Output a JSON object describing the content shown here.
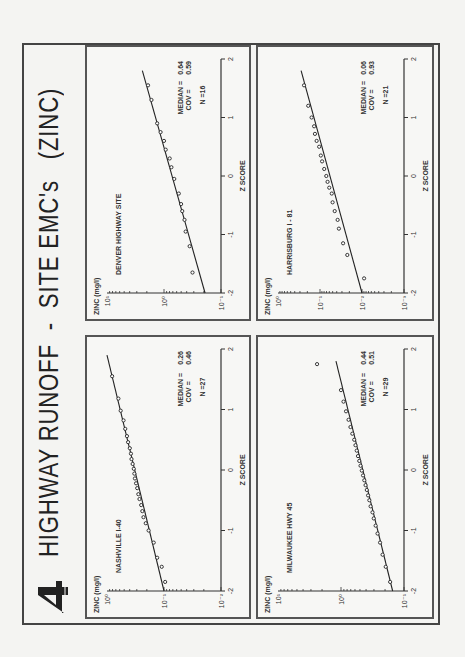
{
  "page": {
    "figure_number": "4",
    "title": "HIGHWAY RUNOFF  -  SITE EMC's   (ZINC)"
  },
  "chart_data": [
    {
      "type": "scatter",
      "title": "NASHVILLE  I-40",
      "xlabel": "Z  SCORE",
      "ylabel": "ZINC  (mg/l)",
      "x_ticks": [
        "-2",
        "-1",
        "0",
        "1",
        "2"
      ],
      "y_ticks": [
        "10^-2",
        "10^-1",
        "10^0"
      ],
      "y_tick_labels": [
        "10⁻²",
        "10⁻¹",
        "10⁰"
      ],
      "yscale": "log",
      "ylim_log10": [
        -2,
        0
      ],
      "xlim": [
        -2,
        2
      ],
      "stats": {
        "median_label": "MEDIAN =",
        "median": "0.26",
        "cov_label": "COV   =",
        "cov": "0.46",
        "n_label": "N =27"
      },
      "fit_line": {
        "x": [
          -2,
          1.9
        ],
        "log10_y": [
          -1.0,
          0.0
        ]
      },
      "points": {
        "x": [
          -1.85,
          -1.6,
          -1.45,
          -1.2,
          -1.0,
          -0.88,
          -0.78,
          -0.68,
          -0.58,
          -0.48,
          -0.4,
          -0.3,
          -0.22,
          -0.14,
          -0.06,
          0.02,
          0.1,
          0.18,
          0.27,
          0.36,
          0.46,
          0.56,
          0.68,
          0.82,
          0.98,
          1.18,
          1.55
        ],
        "log10_y": [
          -1.02,
          -0.96,
          -0.88,
          -0.82,
          -0.73,
          -0.68,
          -0.64,
          -0.62,
          -0.6,
          -0.57,
          -0.55,
          -0.53,
          -0.51,
          -0.49,
          -0.48,
          -0.47,
          -0.45,
          -0.43,
          -0.42,
          -0.4,
          -0.37,
          -0.35,
          -0.32,
          -0.29,
          -0.24,
          -0.2,
          -0.09
        ]
      }
    },
    {
      "type": "scatter",
      "title": "DENVER  HIGHWAY SITE",
      "xlabel": "Z  SCORE",
      "ylabel": "ZINC  (mg/l)",
      "x_ticks": [
        "-2",
        "-1",
        "0",
        "1",
        "2"
      ],
      "y_ticks": [
        "10^-1",
        "10^0",
        "10^1"
      ],
      "y_tick_labels": [
        "10⁻¹",
        "10⁰",
        "10¹"
      ],
      "yscale": "log",
      "ylim_log10": [
        -1,
        1
      ],
      "xlim": [
        -2,
        2
      ],
      "stats": {
        "median_label": "MEDIAN =",
        "median": "0.64",
        "cov_label": "COV   =",
        "cov": "0.59",
        "n_label": "N =16"
      },
      "fit_line": {
        "x": [
          -2,
          1.8
        ],
        "log10_y": [
          -0.72,
          0.38
        ]
      },
      "points": {
        "x": [
          -1.65,
          -1.2,
          -0.95,
          -0.75,
          -0.6,
          -0.48,
          -0.3,
          -0.05,
          0.15,
          0.3,
          0.45,
          0.6,
          0.75,
          0.9,
          1.3,
          1.55
        ],
        "log10_y": [
          -0.5,
          -0.45,
          -0.38,
          -0.36,
          -0.32,
          -0.3,
          -0.26,
          -0.18,
          -0.13,
          -0.1,
          -0.03,
          0.0,
          0.06,
          0.12,
          0.22,
          0.28
        ]
      }
    },
    {
      "type": "scatter",
      "title": "MILWAUKEE  HWY 45",
      "xlabel": "Z  SCORE",
      "ylabel": "ZINC  (mg/l)",
      "x_ticks": [
        "-2",
        "-1",
        "0",
        "1",
        "2"
      ],
      "y_ticks": [
        "10^-1",
        "10^0",
        "10^1"
      ],
      "y_tick_labels": [
        "10⁻¹",
        "10⁰",
        "10¹"
      ],
      "yscale": "log",
      "ylim_log10": [
        -1,
        1
      ],
      "xlim": [
        -2,
        2
      ],
      "stats": {
        "median_label": "MEDIAN =",
        "median": "0.44",
        "cov_label": "COV   =",
        "cov": "0.51",
        "n_label": "N =29"
      },
      "fit_line": {
        "x": [
          -2,
          1.8
        ],
        "log10_y": [
          -0.82,
          0.08
        ]
      },
      "points": {
        "x": [
          -1.85,
          -1.6,
          -1.4,
          -1.2,
          -1.05,
          -0.92,
          -0.8,
          -0.7,
          -0.6,
          -0.5,
          -0.42,
          -0.33,
          -0.25,
          -0.17,
          -0.09,
          -0.01,
          0.07,
          0.15,
          0.23,
          0.32,
          0.41,
          0.5,
          0.6,
          0.71,
          0.83,
          0.97,
          1.13,
          1.32,
          1.75
        ],
        "log10_y": [
          -0.78,
          -0.71,
          -0.66,
          -0.62,
          -0.58,
          -0.55,
          -0.52,
          -0.5,
          -0.47,
          -0.45,
          -0.43,
          -0.41,
          -0.39,
          -0.37,
          -0.35,
          -0.33,
          -0.31,
          -0.29,
          -0.27,
          -0.25,
          -0.23,
          -0.21,
          -0.18,
          -0.15,
          -0.12,
          -0.08,
          -0.04,
          0.0,
          0.38
        ]
      }
    },
    {
      "type": "scatter",
      "title": "HARRISBURG   I - 81",
      "xlabel": "Z  SCORE",
      "ylabel": "ZINC  (mg/l)",
      "x_ticks": [
        "-2",
        "-1",
        "0",
        "1",
        "2"
      ],
      "y_ticks": [
        "10^-3",
        "10^-2",
        "10^-1",
        "10^0"
      ],
      "y_tick_labels": [
        "10⁻³",
        "10⁻²",
        "10⁻¹",
        "10⁰"
      ],
      "yscale": "log",
      "ylim_log10": [
        -3,
        0
      ],
      "xlim": [
        -2,
        2
      ],
      "stats": {
        "median_label": "MEDIAN =",
        "median": "0.06",
        "cov_label": "COV   =",
        "cov": "0.93",
        "n_label": "N =21"
      },
      "fit_line": {
        "x": [
          -2,
          1.8
        ],
        "log10_y": [
          -2.0,
          -0.55
        ]
      },
      "points": {
        "x": [
          -1.75,
          -1.35,
          -1.15,
          -0.9,
          -0.75,
          -0.6,
          -0.45,
          -0.3,
          -0.2,
          -0.1,
          0.0,
          0.12,
          0.25,
          0.35,
          0.5,
          0.6,
          0.72,
          0.85,
          1.0,
          1.2,
          1.55
        ],
        "log10_y": [
          -2.05,
          -1.65,
          -1.55,
          -1.45,
          -1.42,
          -1.35,
          -1.3,
          -1.28,
          -1.22,
          -1.18,
          -1.15,
          -1.1,
          -1.05,
          -1.02,
          -0.98,
          -0.92,
          -0.88,
          -0.86,
          -0.8,
          -0.72,
          -0.62
        ]
      }
    }
  ]
}
